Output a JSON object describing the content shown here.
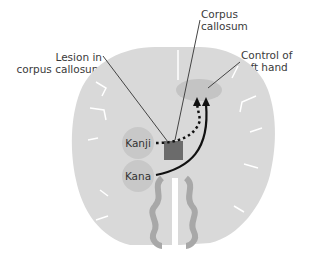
{
  "diagram": {
    "labels": {
      "lesion": [
        "Lesion in",
        "corpus callosum"
      ],
      "corpus": [
        "Corpus",
        "callosum"
      ],
      "control": [
        "Control of",
        "left hand"
      ]
    },
    "nodes": {
      "kanji": "Kanji",
      "kana": "Kana"
    },
    "colors": {
      "brain": "#d9d9d9",
      "sulci": "#ffffff",
      "node_fill": "#c8c8c8",
      "lesion": "#6b6b6b",
      "target": "#c4c4c4",
      "arrow": "#111111",
      "leader": "#444444"
    }
  }
}
